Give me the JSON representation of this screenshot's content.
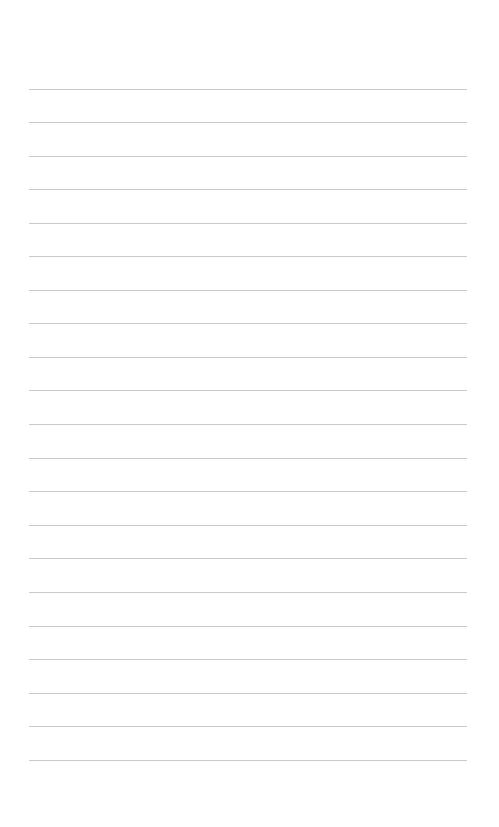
{
  "page": {
    "type": "lined-paper",
    "background_color": "#ffffff",
    "rule_color": "#c9c9c9",
    "rule_count": 21,
    "rules_y": [
      89,
      122,
      156,
      189,
      223,
      256,
      290,
      323,
      357,
      390,
      424,
      458,
      491,
      525,
      558,
      592,
      626,
      659,
      693,
      726,
      760
    ],
    "rule_left": 29,
    "rule_width": 438
  }
}
